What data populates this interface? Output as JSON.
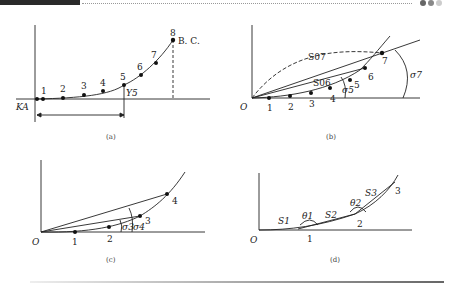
{
  "header": {
    "pager_dots": [
      {
        "color": "#666666"
      },
      {
        "color": "#888888"
      },
      {
        "color": "#cccccc"
      }
    ]
  },
  "figures": [
    {
      "id": "a",
      "caption": "(a)",
      "origin_label": "KA",
      "end_label": "B. C.",
      "ys_label": "Y5",
      "points": [
        "1",
        "2",
        "3",
        "4",
        "5",
        "6",
        "7",
        "8"
      ]
    },
    {
      "id": "b",
      "caption": "(b)",
      "origin_label": "O",
      "chord_labels": [
        "S07",
        "S06"
      ],
      "angle_labels": [
        "σ5",
        "σ7"
      ],
      "points": [
        "1",
        "2",
        "3",
        "4",
        "5",
        "6",
        "7"
      ]
    },
    {
      "id": "c",
      "caption": "(c)",
      "origin_label": "O",
      "angle_labels": [
        "σ3",
        "σ4"
      ],
      "points": [
        "1",
        "2",
        "3",
        "4"
      ]
    },
    {
      "id": "d",
      "caption": "(d)",
      "origin_label": "O",
      "segment_labels": [
        "S1",
        "S2",
        "S3"
      ],
      "angle_labels": [
        "θ1",
        "θ2"
      ],
      "points": [
        "1",
        "2",
        "3"
      ]
    }
  ]
}
